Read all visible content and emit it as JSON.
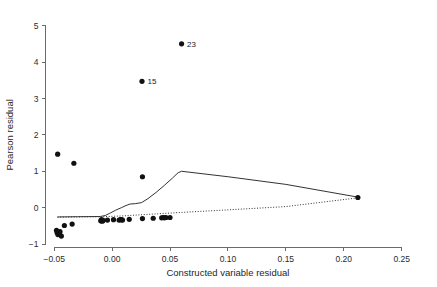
{
  "chart_data": {
    "type": "scatter",
    "title": "",
    "xlabel": "Constructed variable residual",
    "ylabel": "Pearson residual",
    "xlim": [
      -0.0575,
      0.2585
    ],
    "ylim": [
      -1.08,
      5.1
    ],
    "xticks": [
      -0.05,
      0.0,
      0.05,
      0.1,
      0.15,
      0.2,
      0.25
    ],
    "xticklabels": [
      "-0.05",
      "0.00",
      "0.05",
      "0.10",
      "0.15",
      "0.20",
      "0.25"
    ],
    "yticks": [
      -1,
      0,
      1,
      2,
      3,
      4,
      5
    ],
    "yticklabels": [
      "-1",
      "0",
      "1",
      "2",
      "3",
      "4",
      "5"
    ],
    "grid": false,
    "legend": false,
    "marker": "filled-circle",
    "marker_size": 2.6,
    "points": [
      {
        "x": -0.048,
        "y": -0.62
      },
      {
        "x": -0.0475,
        "y": -0.68
      },
      {
        "x": -0.0468,
        "y": -0.74
      },
      {
        "x": -0.0455,
        "y": -0.7
      },
      {
        "x": -0.045,
        "y": -0.66
      },
      {
        "x": -0.0438,
        "y": -0.78
      },
      {
        "x": -0.0412,
        "y": -0.49
      },
      {
        "x": -0.0345,
        "y": -0.45
      },
      {
        "x": -0.047,
        "y": 1.47
      },
      {
        "x": -0.033,
        "y": 1.22
      },
      {
        "x": -0.0098,
        "y": -0.36
      },
      {
        "x": -0.0092,
        "y": -0.33
      },
      {
        "x": -0.0085,
        "y": -0.37
      },
      {
        "x": -0.0078,
        "y": -0.35
      },
      {
        "x": -0.004,
        "y": -0.34
      },
      {
        "x": 0.0012,
        "y": -0.33
      },
      {
        "x": 0.006,
        "y": -0.34
      },
      {
        "x": 0.0072,
        "y": -0.33
      },
      {
        "x": 0.0082,
        "y": -0.33
      },
      {
        "x": 0.009,
        "y": -0.34
      },
      {
        "x": 0.0148,
        "y": -0.32
      },
      {
        "x": 0.0262,
        "y": -0.3
      },
      {
        "x": 0.0355,
        "y": -0.29
      },
      {
        "x": 0.0428,
        "y": -0.28
      },
      {
        "x": 0.044,
        "y": -0.27
      },
      {
        "x": 0.0452,
        "y": -0.28
      },
      {
        "x": 0.0465,
        "y": -0.27
      },
      {
        "x": 0.05,
        "y": -0.27
      },
      {
        "x": 0.0262,
        "y": 0.85
      },
      {
        "x": 0.2122,
        "y": 0.28
      }
    ],
    "labeled_points": [
      {
        "x": 0.06,
        "y": 4.5,
        "label": "23"
      },
      {
        "x": 0.0258,
        "y": 3.47,
        "label": "15"
      }
    ],
    "lines": [
      {
        "name": "lowess-smooth",
        "style": "solid",
        "points": [
          [
            -0.0472,
            -0.255
          ],
          [
            -0.04,
            -0.252
          ],
          [
            -0.03,
            -0.248
          ],
          [
            -0.02,
            -0.245
          ],
          [
            -0.012,
            -0.243
          ],
          [
            -0.0098,
            -0.24
          ],
          [
            -0.006,
            -0.215
          ],
          [
            -0.002,
            -0.155
          ],
          [
            0.003,
            -0.07
          ],
          [
            0.008,
            0.0
          ],
          [
            0.012,
            0.06
          ],
          [
            0.0155,
            0.1
          ],
          [
            0.02,
            0.11
          ],
          [
            0.0255,
            0.14
          ],
          [
            0.031,
            0.25
          ],
          [
            0.038,
            0.42
          ],
          [
            0.045,
            0.61
          ],
          [
            0.052,
            0.81
          ],
          [
            0.057,
            0.96
          ],
          [
            0.06,
            1.0
          ],
          [
            0.1,
            0.85
          ],
          [
            0.15,
            0.64
          ],
          [
            0.2122,
            0.29
          ]
        ]
      },
      {
        "name": "reference-dotted",
        "style": "dotted",
        "points": [
          [
            -0.0472,
            -0.26
          ],
          [
            -0.03,
            -0.255
          ],
          [
            -0.01,
            -0.25
          ],
          [
            0.01,
            -0.225
          ],
          [
            0.03,
            -0.185
          ],
          [
            0.06,
            -0.13
          ],
          [
            0.1,
            -0.06
          ],
          [
            0.15,
            0.03
          ],
          [
            0.2122,
            0.27
          ]
        ]
      }
    ]
  },
  "axes": {
    "x_title": "Constructed variable residual",
    "y_title": "Pearson residual"
  }
}
